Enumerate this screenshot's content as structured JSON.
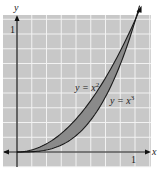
{
  "chart_data": {
    "type": "area",
    "title": "",
    "xlabel": "x",
    "ylabel": "y",
    "xlim": [
      -0.1,
      1.05
    ],
    "ylim": [
      -0.1,
      1.05
    ],
    "x_ticks": [
      "1"
    ],
    "y_ticks": [
      "1"
    ],
    "grid": true,
    "series": [
      {
        "name": "y = x^2",
        "label": "y = x",
        "exponent": "2",
        "function": "x^2",
        "domain": [
          0,
          1
        ]
      },
      {
        "name": "y = x^3",
        "label": "y = x",
        "exponent": "3",
        "function": "x^3",
        "domain": [
          0,
          1
        ]
      }
    ],
    "shaded_region": "between y = x^2 and y = x^3 for 0 ≤ x ≤ 1",
    "colors": {
      "background": "#c8c8c8",
      "grid": "#f2f2f2",
      "fill": "#8a8a8a",
      "curve": "#1a1a1a"
    }
  }
}
